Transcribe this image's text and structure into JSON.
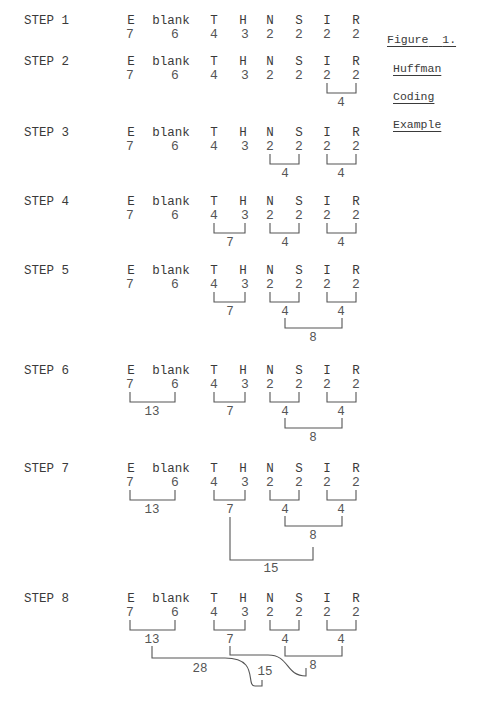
{
  "figure": {
    "title": "Figure",
    "number": "1.",
    "caption_lines": [
      "Huffman",
      "Coding",
      "Example"
    ]
  },
  "columns": {
    "symbols": [
      "E",
      "blank",
      "T",
      "H",
      "N",
      "S",
      "I",
      "R"
    ],
    "x": [
      131,
      171,
      214,
      243,
      270,
      299,
      327,
      356
    ],
    "num_x": [
      130,
      175,
      214,
      245,
      270,
      299,
      327,
      356
    ]
  },
  "initial_weights": [
    "7",
    "6",
    "4",
    "3",
    "2",
    "2",
    "2",
    "2"
  ],
  "steps": [
    {
      "label": "STEP 1",
      "y": 22,
      "weights": [
        "7",
        "6",
        "4",
        "3",
        "2",
        "2",
        "2",
        "2"
      ],
      "merges": []
    },
    {
      "label": "STEP 2",
      "y": 63,
      "weights": [
        "7",
        "6",
        "4",
        "3",
        "2",
        "2",
        "2",
        "2"
      ],
      "merges": [
        {
          "name": "I+R",
          "sum": "4"
        }
      ]
    },
    {
      "label": "STEP 3",
      "y": 134,
      "weights": [
        "7",
        "6",
        "4",
        "3",
        "2",
        "2",
        "2",
        "2"
      ],
      "merges": [
        {
          "name": "N+S",
          "sum": "4"
        },
        {
          "name": "I+R",
          "sum": "4"
        }
      ]
    },
    {
      "label": "STEP 4",
      "y": 203,
      "weights": [
        "7",
        "6",
        "4",
        "3",
        "2",
        "2",
        "2",
        "2"
      ],
      "merges": [
        {
          "name": "T+H",
          "sum": "7"
        },
        {
          "name": "N+S",
          "sum": "4"
        },
        {
          "name": "I+R",
          "sum": "4"
        }
      ]
    },
    {
      "label": "STEP 5",
      "y": 272,
      "weights": [
        "7",
        "6",
        "4",
        "3",
        "2",
        "2",
        "2",
        "2"
      ],
      "merges": [
        {
          "name": "T+H",
          "sum": "7"
        },
        {
          "name": "N+S",
          "sum": "4"
        },
        {
          "name": "I+R",
          "sum": "4"
        },
        {
          "name": "NS+IR",
          "sum": "8"
        }
      ]
    },
    {
      "label": "STEP 6",
      "y": 372,
      "weights": [
        "7",
        "6",
        "4",
        "3",
        "2",
        "2",
        "2",
        "2"
      ],
      "merges": [
        {
          "name": "E+blank",
          "sum": "13"
        },
        {
          "name": "T+H",
          "sum": "7"
        },
        {
          "name": "N+S",
          "sum": "4"
        },
        {
          "name": "I+R",
          "sum": "4"
        },
        {
          "name": "NS+IR",
          "sum": "8"
        }
      ]
    },
    {
      "label": "STEP 7",
      "y": 470,
      "weights": [
        "7",
        "6",
        "4",
        "3",
        "2",
        "2",
        "2",
        "2"
      ],
      "merges": [
        {
          "name": "E+blank",
          "sum": "13"
        },
        {
          "name": "T+H",
          "sum": "7"
        },
        {
          "name": "N+S",
          "sum": "4"
        },
        {
          "name": "I+R",
          "sum": "4"
        },
        {
          "name": "NS+IR",
          "sum": "8"
        },
        {
          "name": "TH+NSIR",
          "sum": "15"
        }
      ]
    },
    {
      "label": "STEP 8",
      "y": 600,
      "weights": [
        "7",
        "6",
        "4",
        "3",
        "2",
        "2",
        "2",
        "2"
      ],
      "merges": [
        {
          "name": "E+blank",
          "sum": "13"
        },
        {
          "name": "T+H",
          "sum": "7"
        },
        {
          "name": "N+S",
          "sum": "4"
        },
        {
          "name": "I+R",
          "sum": "4"
        },
        {
          "name": "NS+IR",
          "sum": "8"
        },
        {
          "name": "TH+NSIR",
          "sum": "15"
        },
        {
          "name": "Eblank+rest",
          "sum": "28"
        }
      ]
    }
  ]
}
